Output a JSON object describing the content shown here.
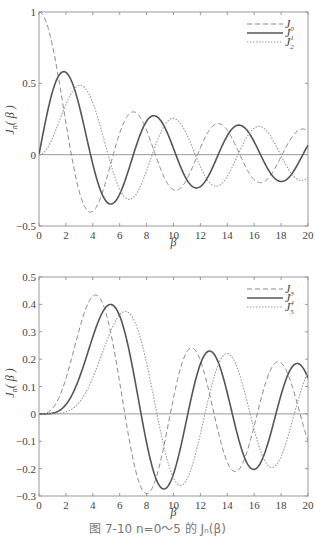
{
  "chart_data": [
    {
      "type": "line",
      "title": "",
      "xlabel": "β",
      "ylabel": "J_n(β)",
      "xlim": [
        0,
        20
      ],
      "ylim": [
        -0.5,
        1
      ],
      "xticks": [
        "0",
        "2",
        "4",
        "6",
        "8",
        "10",
        "12",
        "14",
        "16",
        "18",
        "20"
      ],
      "yticks": [
        "1",
        "0.5",
        "0",
        "−0.5"
      ],
      "ytick_values": [
        1,
        0.5,
        0,
        -0.5
      ],
      "grid": false,
      "zero_line": true,
      "legend_position": "upper right",
      "series": [
        {
          "name": "J0",
          "label_base": "J",
          "label_sub": "0",
          "order": 0,
          "style": "dashed",
          "x": [
            0,
            1,
            2,
            2.405,
            3,
            3.832,
            4,
            5,
            5.52,
            6,
            7,
            7.016,
            8,
            8.654,
            9,
            10,
            10.17,
            11,
            11.79,
            12,
            13,
            13.32,
            14,
            14.93,
            15,
            16,
            17,
            18,
            18.07,
            19,
            20
          ],
          "values": [
            1,
            0.765,
            0.224,
            0,
            -0.26,
            -0.403,
            -0.397,
            -0.178,
            0,
            0.151,
            0.3,
            0.3,
            0.172,
            0,
            -0.09,
            -0.246,
            -0.25,
            -0.171,
            0,
            0.048,
            0.207,
            0.218,
            0.171,
            0,
            -0.014,
            -0.175,
            -0.17,
            -0.013,
            0,
            0.147,
            0.167
          ]
        },
        {
          "name": "J1",
          "label_base": "J",
          "label_sub": "1",
          "order": 1,
          "style": "solid",
          "x": [
            0,
            1,
            1.841,
            3,
            3.832,
            5,
            5.331,
            6,
            7,
            7.016,
            8,
            8.536,
            9,
            10,
            10.17,
            11,
            11.71,
            12,
            13,
            13.32,
            14,
            14.86,
            15,
            16,
            17,
            18,
            18.0,
            19,
            20
          ],
          "values": [
            0,
            0.44,
            0.582,
            0.339,
            0,
            -0.328,
            -0.346,
            -0.277,
            -0.005,
            0,
            0.235,
            0.273,
            0.245,
            0.043,
            0,
            -0.177,
            -0.213,
            -0.223,
            -0.07,
            0,
            0.133,
            0.188,
            0.205,
            0.09,
            -0.098,
            -0.188,
            -0.188,
            -0.106,
            0.067
          ]
        },
        {
          "name": "J2",
          "label_base": "J",
          "label_sub": "2",
          "order": 2,
          "style": "dotted",
          "x": [
            0,
            1,
            2,
            3,
            3.054,
            4,
            5,
            5.136,
            6,
            6.706,
            7,
            8,
            8.417,
            9,
            9.969,
            10,
            11,
            11.62,
            12,
            13,
            13.17,
            14,
            15,
            16,
            17,
            18,
            19,
            20
          ],
          "values": [
            0,
            0.115,
            0.353,
            0.486,
            0.486,
            0.364,
            0.047,
            0,
            -0.243,
            -0.301,
            -0.301,
            -0.113,
            0,
            0.145,
            0.255,
            0.255,
            0.139,
            0,
            -0.085,
            -0.218,
            -0.223,
            -0.152,
            0.041,
            0.186,
            0.158,
            -0.019,
            -0.158,
            -0.16
          ]
        }
      ]
    },
    {
      "type": "line",
      "title": "",
      "xlabel": "β",
      "ylabel": "J_n(β)",
      "xlim": [
        0,
        20
      ],
      "ylim": [
        -0.3,
        0.5
      ],
      "xticks": [
        "0",
        "2",
        "4",
        "6",
        "8",
        "10",
        "12",
        "14",
        "16",
        "18",
        "20"
      ],
      "yticks": [
        "0.5",
        "0.4",
        "0.3",
        "0.2",
        "0.1",
        "0",
        "−0.1",
        "−0.2",
        "−0.3"
      ],
      "ytick_values": [
        0.5,
        0.4,
        0.3,
        0.2,
        0.1,
        0,
        -0.1,
        -0.2,
        -0.3
      ],
      "grid": false,
      "zero_line": true,
      "legend_position": "upper right",
      "series": [
        {
          "name": "J3",
          "label_base": "J",
          "label_sub": "3",
          "order": 3,
          "style": "dashed",
          "x": [
            0,
            2,
            4.201,
            6.38,
            8.015,
            9.761,
            11.35,
            13.02,
            14.59,
            16.22,
            17.79,
            19.41,
            20
          ],
          "values": [
            0,
            0.129,
            0.434,
            0,
            -0.291,
            0,
            0.241,
            0,
            -0.211,
            0,
            0.19,
            0,
            -0.099
          ]
        },
        {
          "name": "J4",
          "label_base": "J",
          "label_sub": "4",
          "order": 4,
          "style": "solid",
          "x": [
            0,
            2,
            5.318,
            7.588,
            9.282,
            11.06,
            12.68,
            14.37,
            15.96,
            17.62,
            19.22,
            20
          ],
          "values": [
            0,
            0.034,
            0.4,
            0,
            -0.272,
            0,
            0.23,
            0,
            -0.204,
            0,
            0.181,
            0.131
          ]
        },
        {
          "name": "J5",
          "label_base": "J",
          "label_sub": "5",
          "order": 5,
          "style": "dotted",
          "x": [
            0,
            2,
            6.416,
            8.771,
            10.52,
            12.34,
            13.99,
            15.7,
            17.31,
            18.98,
            20
          ],
          "values": [
            0,
            0.007,
            0.374,
            0,
            -0.256,
            0,
            0.22,
            0,
            -0.197,
            0,
            0.151
          ]
        }
      ]
    }
  ],
  "caption": "图 7-10   n=0～5 的 Jₙ(β)"
}
